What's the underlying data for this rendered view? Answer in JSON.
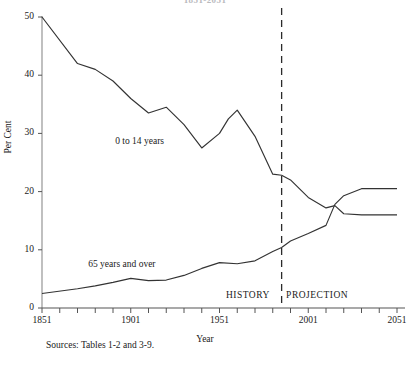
{
  "figure": {
    "clipped_title": "1851-2051",
    "source_note": "Sources:  Tables 1-2 and 3-9.",
    "period_history": "HISTORY",
    "period_projection": "PROJECTION",
    "divider_year": 1986
  },
  "chart_data": {
    "type": "line",
    "title": "1851-2051",
    "xlabel": "Year",
    "ylabel": "Per Cent",
    "xlim": [
      1851,
      2051
    ],
    "ylim": [
      0,
      50
    ],
    "xticks": [
      1851,
      1901,
      1951,
      2001,
      2051
    ],
    "xtick_labels": [
      "1851",
      "1901",
      "1951",
      "2001",
      "2051"
    ],
    "xtick_minor_step": 10,
    "yticks": [
      0,
      10,
      20,
      30,
      40,
      50
    ],
    "ytick_labels": [
      "0",
      "10",
      "20",
      "30",
      "40",
      "50"
    ],
    "grid": false,
    "legend": "inline-annotations",
    "annotations": [
      {
        "text": "0 to 14 years",
        "x": 1906,
        "y": 28.5
      },
      {
        "text": "65 years and over",
        "x": 1896,
        "y": 7.4
      },
      {
        "text": "HISTORY",
        "x": 1967,
        "y": 2.0
      },
      {
        "text": "PROJECTION",
        "x": 2006,
        "y": 2.0
      }
    ],
    "vertical_divider": {
      "year": 1986,
      "style": "dashed",
      "label_left": "HISTORY",
      "label_right": "PROJECTION"
    },
    "series": [
      {
        "name": "0 to 14 years",
        "x": [
          1851,
          1871,
          1881,
          1891,
          1901,
          1911,
          1921,
          1931,
          1941,
          1951,
          1956,
          1961,
          1971,
          1981,
          1986,
          1991,
          2001,
          2011,
          2016,
          2021,
          2031,
          2051
        ],
        "values": [
          50.0,
          42.0,
          41.0,
          39.0,
          36.0,
          33.5,
          34.5,
          31.5,
          27.5,
          30.0,
          32.5,
          34.0,
          29.5,
          23.0,
          22.8,
          22.0,
          19.0,
          17.2,
          17.6,
          16.2,
          16.0,
          16.0
        ]
      },
      {
        "name": "65 years and over",
        "x": [
          1851,
          1871,
          1881,
          1891,
          1901,
          1911,
          1921,
          1931,
          1941,
          1951,
          1961,
          1971,
          1981,
          1986,
          1991,
          2001,
          2011,
          2016,
          2021,
          2031,
          2051
        ],
        "values": [
          2.5,
          3.3,
          3.8,
          4.4,
          5.1,
          4.7,
          4.8,
          5.6,
          6.8,
          7.8,
          7.6,
          8.1,
          9.7,
          10.4,
          11.5,
          12.8,
          14.2,
          17.8,
          19.3,
          20.5,
          20.5
        ]
      }
    ]
  }
}
